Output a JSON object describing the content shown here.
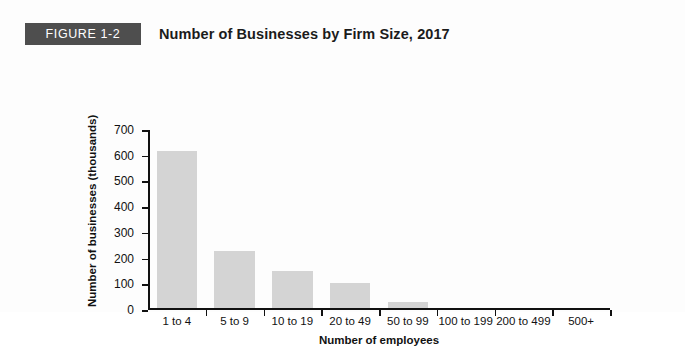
{
  "figure": {
    "badge_label": "FIGURE 1-2",
    "title": "Number of Businesses by Firm Size, 2017"
  },
  "colors": {
    "badge_background": "#4e4e4e",
    "badge_text": "#ffffff",
    "bar_fill": "#d4d4d4",
    "axis": "#111111",
    "page_background": "#fdfdfd",
    "title_text": "#1b1b1b"
  },
  "chart_data": {
    "type": "bar",
    "title": "Number of Businesses by Firm Size, 2017",
    "subtitle": "",
    "xlabel": "Number of employees",
    "ylabel": "Number of businesses (thousands)",
    "categories": [
      "1 to 4",
      "5 to 9",
      "10 to 19",
      "20 to 49",
      "50 to 99",
      "100 to 199",
      "200 to 499",
      "500+"
    ],
    "values": [
      620,
      225,
      145,
      100,
      25,
      0,
      0,
      0
    ],
    "ylim": [
      0,
      700
    ],
    "ytick_labels": [
      "700",
      "600",
      "500",
      "400",
      "300",
      "200",
      "100",
      "0"
    ],
    "ytick_values": [
      700,
      600,
      500,
      400,
      300,
      200,
      100,
      0
    ],
    "ytick_step": 100,
    "grid": false,
    "legend": false,
    "legend_position": "none",
    "annotations": []
  }
}
